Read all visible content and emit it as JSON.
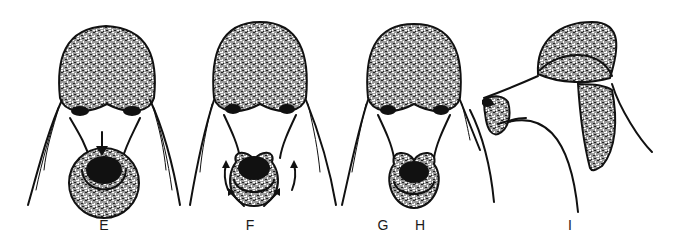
{
  "figure": {
    "background": "#ffffff",
    "ink_color": "#111111",
    "panels": [
      {
        "id": "E",
        "label": "E",
        "view": "front",
        "annotation": "downward arrow above nose"
      },
      {
        "id": "F",
        "label": "F",
        "view": "front",
        "annotation": "curved arrows around muzzle"
      },
      {
        "id": "G",
        "label": "G",
        "view": "front"
      },
      {
        "id": "H",
        "label": "H",
        "view": "front"
      },
      {
        "id": "I",
        "label": "I",
        "view": "profile"
      }
    ]
  }
}
